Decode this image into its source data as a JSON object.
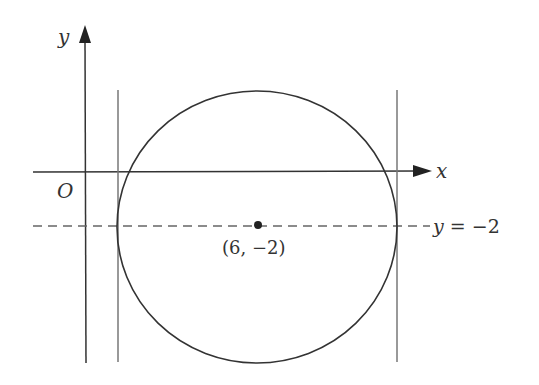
{
  "diagram": {
    "type": "coordinate-geometry",
    "axes": {
      "x_label": "x",
      "y_label": "y",
      "origin_label": "O"
    },
    "center": {
      "label": "(6, −2)",
      "x": 6,
      "y": -2
    },
    "dashed_line": {
      "label": "y = −2"
    },
    "colors": {
      "stroke": "#333333",
      "tangent_lines": "#777777",
      "dashed": "#666666",
      "background": "#ffffff"
    }
  }
}
